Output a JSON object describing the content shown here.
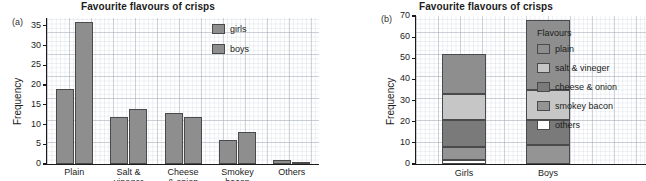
{
  "colors": {
    "plain": "#8e8e8e",
    "salt_vineger": "#c6c6c6",
    "cheese_onion": "#7a7a7a",
    "smokey_bacon": "#949494",
    "others": "#ffffff",
    "girls": "#8e8e8e",
    "boys": "#8e8e8e",
    "axis": "#1a1a1a"
  },
  "panel_a": {
    "tag": "(a)",
    "title": "Favourite flavours of crisps",
    "legend": {
      "items": [
        {
          "label": "girls",
          "color": "#8e8e8e"
        },
        {
          "label": "boys",
          "color": "#8e8e8e"
        }
      ]
    },
    "chart_data": {
      "type": "bar",
      "title": "Favourite flavours of crisps",
      "xlabel": "",
      "ylabel": "Frequency",
      "ylim": [
        0,
        37
      ],
      "yticks": [
        0,
        5,
        10,
        15,
        20,
        25,
        30,
        35
      ],
      "grid": true,
      "legend_position": "top-right",
      "categories": [
        "Plain",
        "Salt & vineger",
        "Cheese & onion",
        "Smokey bacon",
        "Others"
      ],
      "category_lines": [
        [
          "Plain"
        ],
        [
          "Salt &",
          "vineger"
        ],
        [
          "Cheese",
          "& onion"
        ],
        [
          "Smokey",
          "bacon"
        ],
        [
          "Others"
        ]
      ],
      "series": [
        {
          "name": "girls",
          "values": [
            19,
            12,
            13,
            6,
            1
          ]
        },
        {
          "name": "boys",
          "values": [
            36,
            14,
            12,
            8,
            0.5
          ]
        }
      ]
    }
  },
  "panel_b": {
    "tag": "(b)",
    "title": "Favourite flavours of crisps",
    "legend": {
      "title": "Flavours",
      "items": [
        {
          "label": "plain",
          "color": "#8e8e8e"
        },
        {
          "label": "salt & vineger",
          "color": "#c6c6c6"
        },
        {
          "label": "cheese & onion",
          "color": "#7a7a7a"
        },
        {
          "label": "smokey bacon",
          "color": "#949494"
        },
        {
          "label": "others",
          "color": "#ffffff"
        }
      ]
    },
    "chart_data": {
      "type": "bar",
      "stacked": true,
      "title": "Favourite flavours of crisps",
      "xlabel": "",
      "ylabel": "Frequency",
      "ylim": [
        0,
        70
      ],
      "yticks": [
        0,
        10,
        20,
        30,
        40,
        50,
        60,
        70
      ],
      "grid": true,
      "legend_position": "right",
      "legend_title": "Flavours",
      "categories": [
        "Girls",
        "Boys"
      ],
      "series": [
        {
          "name": "others",
          "values": [
            2,
            0
          ]
        },
        {
          "name": "smokey bacon",
          "values": [
            6,
            9
          ]
        },
        {
          "name": "cheese & onion",
          "values": [
            13,
            12
          ]
        },
        {
          "name": "salt & vineger",
          "values": [
            12,
            14
          ]
        },
        {
          "name": "plain",
          "values": [
            19,
            33
          ]
        }
      ],
      "totals": [
        52,
        68
      ],
      "segment_boundaries": {
        "Girls": [
          0,
          2,
          8,
          21,
          33,
          52
        ],
        "Boys": [
          0,
          0,
          9,
          21,
          35,
          68
        ]
      }
    }
  }
}
